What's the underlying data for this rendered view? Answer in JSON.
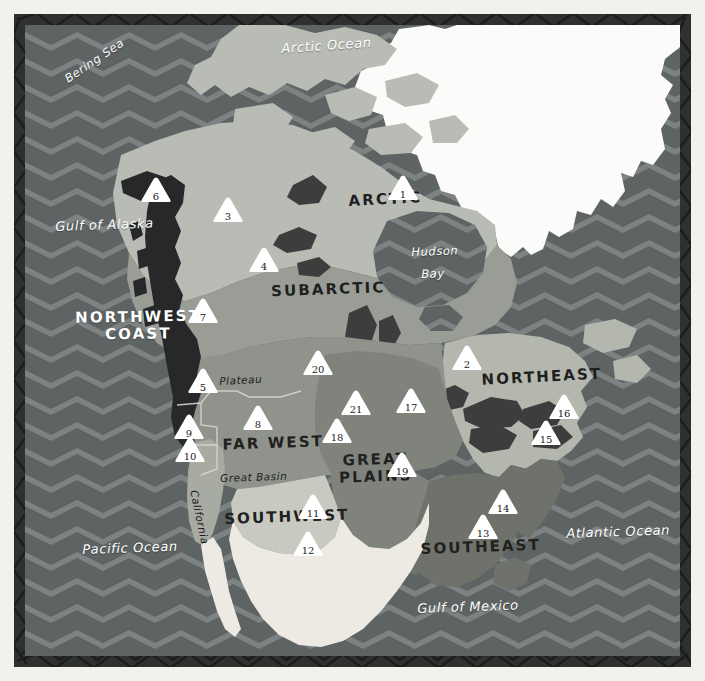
{
  "map": {
    "title": "Native American Culture Areas of North America",
    "palette": {
      "page_background": "#f2f1ee",
      "border_dark": "#2e3130",
      "ocean_dark": "#5e6463",
      "ocean_light": "#7d8382",
      "ice_white": "#fbfbf9",
      "mexico_light": "#eceae2",
      "arctic": "#b9bcb4",
      "subarctic": "#9a9d95",
      "northwest_coast": "#26282a",
      "plateau_farwest": "#8f938b",
      "great_plains": "#7f837c",
      "southwest": "#c8cac1",
      "southeast": "#6e726b",
      "northeast": "#b4b7ae",
      "california": "#a8aba2",
      "lakes": "#3b3e3d",
      "marker_fill": "#ffffff",
      "marker_text": "#1a1a19",
      "label_dark": "#20201f",
      "label_white": "#ffffff"
    },
    "water_labels": [
      {
        "name": "arctic-ocean",
        "text": "Arctic Ocean",
        "x": 281,
        "y": 41,
        "rotate": -4,
        "size": "big"
      },
      {
        "name": "bering-sea",
        "text": "Bering Sea",
        "x": 62,
        "y": 74,
        "rotate": -34,
        "size": "normal"
      },
      {
        "name": "gulf-of-alaska",
        "text": "Gulf of Alaska",
        "x": 55,
        "y": 219,
        "rotate": -2,
        "size": "big"
      },
      {
        "name": "hudson-bay-1",
        "text": "Hudson",
        "x": 411,
        "y": 245,
        "rotate": -2,
        "size": "normal"
      },
      {
        "name": "hudson-bay-2",
        "text": "Bay",
        "x": 421,
        "y": 267,
        "rotate": -2,
        "size": "normal"
      },
      {
        "name": "pacific-ocean",
        "text": "Pacific Ocean",
        "x": 82,
        "y": 542,
        "rotate": -2,
        "size": "big"
      },
      {
        "name": "atlantic-ocean",
        "text": "Atlantic Ocean",
        "x": 566,
        "y": 526,
        "rotate": -2,
        "size": "big"
      },
      {
        "name": "gulf-of-mexico",
        "text": "Gulf of Mexico",
        "x": 417,
        "y": 601,
        "rotate": -2,
        "size": "big"
      }
    ],
    "culture_areas": [
      {
        "name": "arctic",
        "text": "ARCTIC",
        "x": 330,
        "y": 194,
        "w": 110,
        "rotate": -3,
        "color": "dark"
      },
      {
        "name": "subarctic",
        "text": "SUBARCTIC",
        "x": 248,
        "y": 284,
        "w": 160,
        "rotate": -2,
        "color": "dark"
      },
      {
        "name": "northwest-coast",
        "text": "NORTHWEST\nCOAST",
        "x": 68,
        "y": 310,
        "w": 140,
        "rotate": -1,
        "color": "white"
      },
      {
        "name": "far-west",
        "text": "FAR WEST",
        "x": 213,
        "y": 437,
        "w": 120,
        "rotate": -2,
        "color": "dark"
      },
      {
        "name": "great-plains",
        "text": "GREAT\nPLAINS",
        "x": 330,
        "y": 453,
        "w": 90,
        "rotate": -2,
        "color": "dark"
      },
      {
        "name": "southwest",
        "text": "SOUTHWEST",
        "x": 224,
        "y": 511,
        "w": 125,
        "rotate": -2,
        "color": "dark"
      },
      {
        "name": "southeast",
        "text": "SOUTHEAST",
        "x": 418,
        "y": 541,
        "w": 125,
        "rotate": -2,
        "color": "dark"
      },
      {
        "name": "northeast",
        "text": "NORTHEAST",
        "x": 479,
        "y": 372,
        "w": 125,
        "rotate": -3,
        "color": "dark"
      }
    ],
    "sub_labels": [
      {
        "name": "plateau",
        "text": "Plateau",
        "x": 219,
        "y": 375,
        "rotate": -3,
        "vertical": false
      },
      {
        "name": "great-basin",
        "text": "Great Basin",
        "x": 220,
        "y": 472,
        "rotate": -2,
        "vertical": false
      },
      {
        "name": "california",
        "text": "California",
        "x": 200,
        "y": 489,
        "rotate": 78,
        "vertical": true
      }
    ],
    "markers": [
      {
        "id": "1",
        "x": 386,
        "y": 173,
        "size": "sm"
      },
      {
        "id": "2",
        "x": 450,
        "y": 343,
        "size": "sm"
      },
      {
        "id": "3",
        "x": 211,
        "y": 195,
        "size": "sm"
      },
      {
        "id": "4",
        "x": 247,
        "y": 245,
        "size": "sm"
      },
      {
        "id": "5",
        "x": 186,
        "y": 366,
        "size": "sm"
      },
      {
        "id": "6",
        "x": 139,
        "y": 175,
        "size": "sm"
      },
      {
        "id": "7",
        "x": 186,
        "y": 296,
        "size": "sm"
      },
      {
        "id": "8",
        "x": 241,
        "y": 403,
        "size": "sm"
      },
      {
        "id": "9",
        "x": 172,
        "y": 412,
        "size": "sm"
      },
      {
        "id": "10",
        "x": 173,
        "y": 435,
        "size": "sm"
      },
      {
        "id": "11",
        "x": 296,
        "y": 492,
        "size": "sm"
      },
      {
        "id": "12",
        "x": 291,
        "y": 529,
        "size": "sm"
      },
      {
        "id": "13",
        "x": 466,
        "y": 512,
        "size": "sm"
      },
      {
        "id": "14",
        "x": 486,
        "y": 487,
        "size": "sm"
      },
      {
        "id": "15",
        "x": 529,
        "y": 418,
        "size": "sm"
      },
      {
        "id": "16",
        "x": 547,
        "y": 392,
        "size": "sm"
      },
      {
        "id": "17",
        "x": 394,
        "y": 386,
        "size": "sm"
      },
      {
        "id": "18",
        "x": 320,
        "y": 416,
        "size": "sm"
      },
      {
        "id": "19",
        "x": 385,
        "y": 450,
        "size": "sm"
      },
      {
        "id": "20",
        "x": 301,
        "y": 348,
        "size": "sm"
      },
      {
        "id": "21",
        "x": 339,
        "y": 388,
        "size": "sm"
      }
    ]
  }
}
